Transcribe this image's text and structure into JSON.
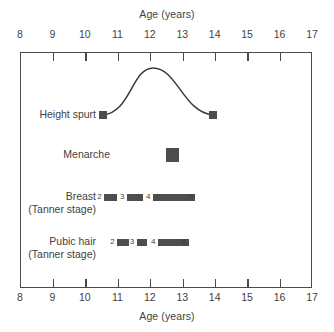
{
  "chart_data": {
    "type": "timeline",
    "title": "",
    "xlabel": "Age (years)",
    "ylabel": "",
    "xlim": [
      8,
      17
    ],
    "xticks": [
      8,
      9,
      10,
      11,
      12,
      13,
      14,
      15,
      16,
      17
    ],
    "xtick_labels": [
      "8",
      "9",
      "10",
      "11",
      "12",
      "13",
      "14",
      "15",
      "16",
      "17"
    ],
    "grid": false,
    "legend": "none",
    "axis_top": {
      "label": "Age (years)"
    },
    "axis_bottom": {
      "label": "Age (years)"
    },
    "marker_color": "#4d4d4d",
    "line_color": "#3a3a3a",
    "rows": [
      {
        "name": "height-spurt",
        "label": "Height spurt",
        "label_line2": "",
        "type": "curve",
        "start_age": 10.55,
        "peak_age": 12.1,
        "end_age": 13.95,
        "endpoint_markers": [
          10.55,
          13.95
        ]
      },
      {
        "name": "menarche",
        "label": "Menarche",
        "label_line2": "",
        "type": "point",
        "age": 12.7
      },
      {
        "name": "breast",
        "label": "Breast",
        "label_line2": "(Tanner stage)",
        "type": "stages",
        "stages": [
          {
            "stage": "2",
            "start_age": 10.6,
            "end_age": 11.0
          },
          {
            "stage": "3",
            "start_age": 11.3,
            "end_age": 11.8
          },
          {
            "stage": "4",
            "start_age": 12.1,
            "end_age": 13.4
          },
          {
            "stage": "5",
            "start_age": 13.4,
            "end_age": 13.4
          }
        ]
      },
      {
        "name": "pubic-hair",
        "label": "Pubic hair",
        "label_line2": "(Tanner stage)",
        "type": "stages",
        "stages": [
          {
            "stage": "2",
            "start_age": 11.0,
            "end_age": 11.35
          },
          {
            "stage": "3",
            "start_age": 11.6,
            "end_age": 11.9
          },
          {
            "stage": "4",
            "start_age": 12.25,
            "end_age": 13.2
          },
          {
            "stage": "5",
            "start_age": 13.2,
            "end_age": 13.2
          }
        ]
      }
    ]
  }
}
